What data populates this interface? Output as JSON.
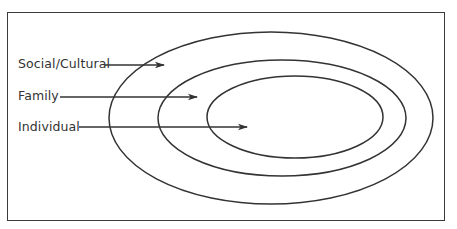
{
  "diagram": {
    "type": "nested-ellipses",
    "colors": {
      "stroke": "#333333",
      "text": "#333333",
      "background": "#ffffff"
    },
    "layers": [
      {
        "label": "Social/Cultural",
        "level": "outer"
      },
      {
        "label": "Family",
        "level": "middle"
      },
      {
        "label": "Individual",
        "level": "inner"
      }
    ]
  }
}
